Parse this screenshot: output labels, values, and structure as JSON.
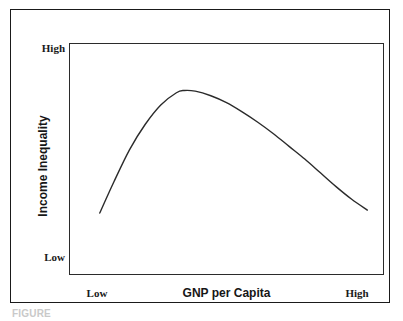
{
  "figure": {
    "caption": "FIGURE"
  },
  "axes": {
    "y": {
      "title": "Income Inequality",
      "tick_high": "High",
      "tick_low": "Low"
    },
    "x": {
      "title": "GNP per Capita",
      "tick_low": "Low",
      "tick_high": "High"
    }
  },
  "colors": {
    "curve": "#2b2b2b",
    "frame": "#1a1a1a",
    "plot_frame": "#2b2b2b",
    "background": "#ffffff",
    "text": "#1a1a1a"
  },
  "chart_data": {
    "type": "line",
    "title": "",
    "subtitle": "",
    "xlabel": "GNP per Capita",
    "ylabel": "Income Inequality",
    "xlim": [
      0,
      100
    ],
    "ylim": [
      0,
      100
    ],
    "xticks": [
      0,
      100
    ],
    "xticklabels": [
      "Low",
      "High"
    ],
    "yticks": [
      0,
      100
    ],
    "yticklabels": [
      "Low",
      "High"
    ],
    "grid": false,
    "legend": null,
    "annotations": [],
    "series": [
      {
        "name": "Kuznets curve",
        "x": [
          9.5,
          14,
          19,
          24,
          29,
          34,
          36.5,
          40,
          45,
          50,
          55,
          60,
          65,
          70,
          75,
          80,
          85,
          90,
          95
        ],
        "y": [
          26.5,
          40,
          54,
          65,
          73.5,
          78.8,
          79.8,
          79.5,
          77.5,
          74.5,
          70.5,
          66,
          61,
          55.5,
          50,
          44,
          38,
          32.5,
          27.8
        ],
        "style": "smooth-curve",
        "color": "#2b2b2b",
        "width": 1.4
      }
    ]
  }
}
